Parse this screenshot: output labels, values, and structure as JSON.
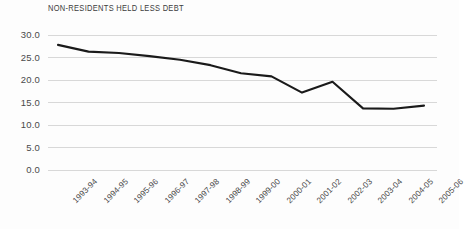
{
  "chart_data": {
    "type": "line",
    "title": "NON-RESIDENTS HELD LESS DEBT",
    "xlabel": "",
    "ylabel": "",
    "categories": [
      "1993-94",
      "1994-95",
      "1995-96",
      "1996-97",
      "1997-98",
      "1998-99",
      "1999-00",
      "2000-01",
      "2001-02",
      "2002-03",
      "2003-04",
      "2004-05",
      "2005-06"
    ],
    "values": [
      27.8,
      26.3,
      26.0,
      25.3,
      24.5,
      23.3,
      21.5,
      20.8,
      17.2,
      19.6,
      13.7,
      13.6,
      14.3
    ],
    "series": [
      {
        "name": "Non-residents held debt",
        "values": [
          27.8,
          26.3,
          26.0,
          25.3,
          24.5,
          23.3,
          21.5,
          20.8,
          17.2,
          19.6,
          13.7,
          13.6,
          14.3
        ]
      }
    ],
    "ylim": [
      0.0,
      30.0
    ],
    "ytick_labels": [
      "30.0",
      "25.0",
      "20.0",
      "15.0",
      "10.0",
      "5.0",
      "0.0"
    ],
    "ytick_values": [
      30.0,
      25.0,
      20.0,
      15.0,
      10.0,
      5.0,
      0.0
    ],
    "grid": "horizontal",
    "legend": "none",
    "line_color": "#1a1a1a",
    "grid_color": "#d8d8d8",
    "text_color": "#4a4a4a",
    "background_color": "#fdfdfd"
  }
}
